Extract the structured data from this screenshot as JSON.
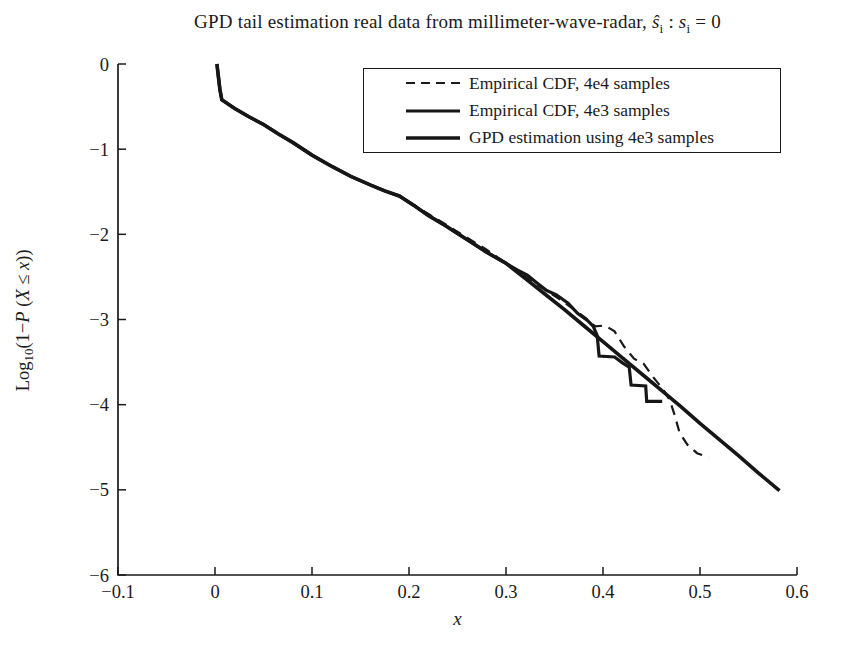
{
  "figure": {
    "title": {
      "prefix": "GPD tail estimation real data from millimeter-wave-radar, ",
      "s_hat": "ŝ",
      "sub_i1": "i",
      "colon": " : ",
      "s": "s",
      "sub_i2": "i",
      "suffix": " = 0"
    },
    "xlabel": "x",
    "ylabel": {
      "p1": "Log",
      "sub": "10",
      "p2": "(1−",
      "P": "P",
      "p3": " (",
      "X": "X",
      "p4": " ≤ ",
      "x": "x",
      "p5": "))"
    }
  },
  "chart_data": {
    "type": "line",
    "xlabel": "x",
    "ylabel": "Log₁₀(1−P (X ≤ x))",
    "xlim": [
      -0.1,
      0.6
    ],
    "ylim": [
      -6,
      0
    ],
    "grid": false,
    "legend_position": "top-right-inside",
    "axis_color": "#1a1a1a",
    "background_color": "#ffffff",
    "xticks": [
      {
        "v": -0.1,
        "label": "−0.1"
      },
      {
        "v": 0,
        "label": "0"
      },
      {
        "v": 0.1,
        "label": "0.1"
      },
      {
        "v": 0.2,
        "label": "0.2"
      },
      {
        "v": 0.3,
        "label": "0.3"
      },
      {
        "v": 0.4,
        "label": "0.4"
      },
      {
        "v": 0.5,
        "label": "0.5"
      },
      {
        "v": 0.6,
        "label": "0.6"
      }
    ],
    "yticks": [
      {
        "v": 0,
        "label": "0"
      },
      {
        "v": -1,
        "label": "−1"
      },
      {
        "v": -2,
        "label": "−2"
      },
      {
        "v": -3,
        "label": "−3"
      },
      {
        "v": -4,
        "label": "−4"
      },
      {
        "v": -5,
        "label": "−5"
      },
      {
        "v": -6,
        "label": "−6"
      }
    ],
    "series": [
      {
        "id": "empirical-cdf-4e4",
        "name": "Empirical CDF, 4e4 samples",
        "style": "dashed",
        "stroke_width": 2.2,
        "color": "#1a1a1a",
        "points": [
          [
            0.2,
            -1.62
          ],
          [
            0.22,
            -1.76
          ],
          [
            0.24,
            -1.9
          ],
          [
            0.26,
            -2.04
          ],
          [
            0.28,
            -2.18
          ],
          [
            0.295,
            -2.3
          ],
          [
            0.31,
            -2.42
          ],
          [
            0.325,
            -2.54
          ],
          [
            0.34,
            -2.65
          ],
          [
            0.355,
            -2.76
          ],
          [
            0.37,
            -2.88
          ],
          [
            0.382,
            -2.98
          ],
          [
            0.392,
            -3.08
          ],
          [
            0.402,
            -3.07
          ],
          [
            0.412,
            -3.14
          ],
          [
            0.422,
            -3.32
          ],
          [
            0.432,
            -3.46
          ],
          [
            0.442,
            -3.52
          ],
          [
            0.452,
            -3.68
          ],
          [
            0.462,
            -3.82
          ],
          [
            0.469,
            -3.95
          ],
          [
            0.474,
            -4.13
          ],
          [
            0.479,
            -4.33
          ],
          [
            0.487,
            -4.47
          ],
          [
            0.497,
            -4.57
          ],
          [
            0.509,
            -4.62
          ]
        ]
      },
      {
        "id": "empirical-cdf-4e3",
        "name": "Empirical CDF, 4e3 samples",
        "style": "solid",
        "stroke_width": 3.2,
        "color": "#161616",
        "points": [
          [
            0.002,
            0
          ],
          [
            0.005,
            -0.3
          ],
          [
            0.007,
            -0.42
          ],
          [
            0.02,
            -0.52
          ],
          [
            0.035,
            -0.62
          ],
          [
            0.05,
            -0.71
          ],
          [
            0.065,
            -0.82
          ],
          [
            0.08,
            -0.92
          ],
          [
            0.1,
            -1.07
          ],
          [
            0.12,
            -1.2
          ],
          [
            0.14,
            -1.32
          ],
          [
            0.16,
            -1.42
          ],
          [
            0.175,
            -1.49
          ],
          [
            0.19,
            -1.55
          ],
          [
            0.205,
            -1.66
          ],
          [
            0.22,
            -1.78
          ],
          [
            0.235,
            -1.88
          ],
          [
            0.25,
            -1.99
          ],
          [
            0.265,
            -2.1
          ],
          [
            0.28,
            -2.21
          ],
          [
            0.295,
            -2.31
          ],
          [
            0.312,
            -2.42
          ],
          [
            0.322,
            -2.48
          ],
          [
            0.332,
            -2.57
          ],
          [
            0.342,
            -2.66
          ],
          [
            0.352,
            -2.71
          ],
          [
            0.364,
            -2.81
          ],
          [
            0.374,
            -2.93
          ],
          [
            0.384,
            -3.01
          ],
          [
            0.39,
            -3.08
          ],
          [
            0.394,
            -3.19
          ],
          [
            0.396,
            -3.43
          ],
          [
            0.412,
            -3.44
          ],
          [
            0.42,
            -3.51
          ],
          [
            0.427,
            -3.56
          ],
          [
            0.429,
            -3.77
          ],
          [
            0.444,
            -3.78
          ],
          [
            0.445,
            -3.96
          ],
          [
            0.461,
            -3.96
          ]
        ]
      },
      {
        "id": "gpd-estimation",
        "name": "GPD estimation using 4e3 samples",
        "style": "solid",
        "stroke_width": 3.6,
        "color": "#161616",
        "points": [
          [
            0.002,
            0
          ],
          [
            0.005,
            -0.3
          ],
          [
            0.007,
            -0.42
          ],
          [
            0.02,
            -0.52
          ],
          [
            0.035,
            -0.62
          ],
          [
            0.05,
            -0.71
          ],
          [
            0.065,
            -0.82
          ],
          [
            0.08,
            -0.92
          ],
          [
            0.1,
            -1.07
          ],
          [
            0.12,
            -1.2
          ],
          [
            0.14,
            -1.32
          ],
          [
            0.16,
            -1.42
          ],
          [
            0.175,
            -1.49
          ],
          [
            0.19,
            -1.55
          ],
          [
            0.205,
            -1.66
          ],
          [
            0.22,
            -1.78
          ],
          [
            0.235,
            -1.88
          ],
          [
            0.25,
            -1.99
          ],
          [
            0.265,
            -2.1
          ],
          [
            0.28,
            -2.21
          ],
          [
            0.3,
            -2.34
          ],
          [
            0.32,
            -2.52
          ],
          [
            0.34,
            -2.7
          ],
          [
            0.36,
            -2.88
          ],
          [
            0.38,
            -3.07
          ],
          [
            0.4,
            -3.26
          ],
          [
            0.42,
            -3.45
          ],
          [
            0.44,
            -3.64
          ],
          [
            0.46,
            -3.83
          ],
          [
            0.48,
            -4.02
          ],
          [
            0.5,
            -4.22
          ],
          [
            0.52,
            -4.41
          ],
          [
            0.54,
            -4.6
          ],
          [
            0.56,
            -4.8
          ],
          [
            0.582,
            -5.01
          ]
        ]
      }
    ]
  }
}
